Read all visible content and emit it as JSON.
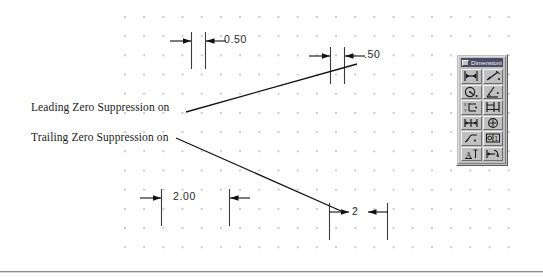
{
  "canvas": {
    "width": 543,
    "height": 278,
    "background": "#ffffff",
    "grid_dot_color": "#c9c9c9"
  },
  "annotations": [
    {
      "id": "leading",
      "text": "Leading Zero Suppression on"
    },
    {
      "id": "trailing",
      "text": "Trailing Zero Suppression on"
    }
  ],
  "dimensions": [
    {
      "id": "dim-a",
      "value": "0.50",
      "note": "top-left dimension, both zeros shown",
      "zero_suppression": "none"
    },
    {
      "id": "dim-b",
      "value": ".50",
      "note": "top-right dimension, leading zero suppressed",
      "zero_suppression": "leading"
    },
    {
      "id": "dim-c",
      "value": "2.00",
      "note": "bottom-left dimension, trailing zeros shown",
      "zero_suppression": "none"
    },
    {
      "id": "dim-d",
      "value": "2",
      "note": "bottom-right dimension, trailing zeros suppressed",
      "zero_suppression": "trailing"
    }
  ],
  "toolbar": {
    "title": "Dimensioning",
    "title_bar_color": "#4b4b66",
    "face_color": "#c0c0c0",
    "columns": 2,
    "buttons": [
      {
        "name": "linear-dimension-icon",
        "tooltip": "Linear Dimension"
      },
      {
        "name": "aligned-dimension-icon",
        "tooltip": "Aligned Dimension"
      },
      {
        "name": "radius-dimension-icon",
        "tooltip": "Radius Dimension"
      },
      {
        "name": "angular-dimension-icon",
        "tooltip": "Angular Dimension"
      },
      {
        "name": "ordinate-dimension-icon",
        "tooltip": "Ordinate Dimension"
      },
      {
        "name": "baseline-dimension-icon",
        "tooltip": "Baseline Dimension"
      },
      {
        "name": "continue-dimension-icon",
        "tooltip": "Continue Dimension"
      },
      {
        "name": "center-mark-icon",
        "tooltip": "Center Mark"
      },
      {
        "name": "leader-icon",
        "tooltip": "Leader"
      },
      {
        "name": "tolerance-icon",
        "tooltip": "Tolerance"
      },
      {
        "name": "dimension-text-edit-icon",
        "tooltip": "Dimension Text Edit"
      },
      {
        "name": "dimension-style-icon",
        "tooltip": "Dimension Style"
      }
    ]
  }
}
